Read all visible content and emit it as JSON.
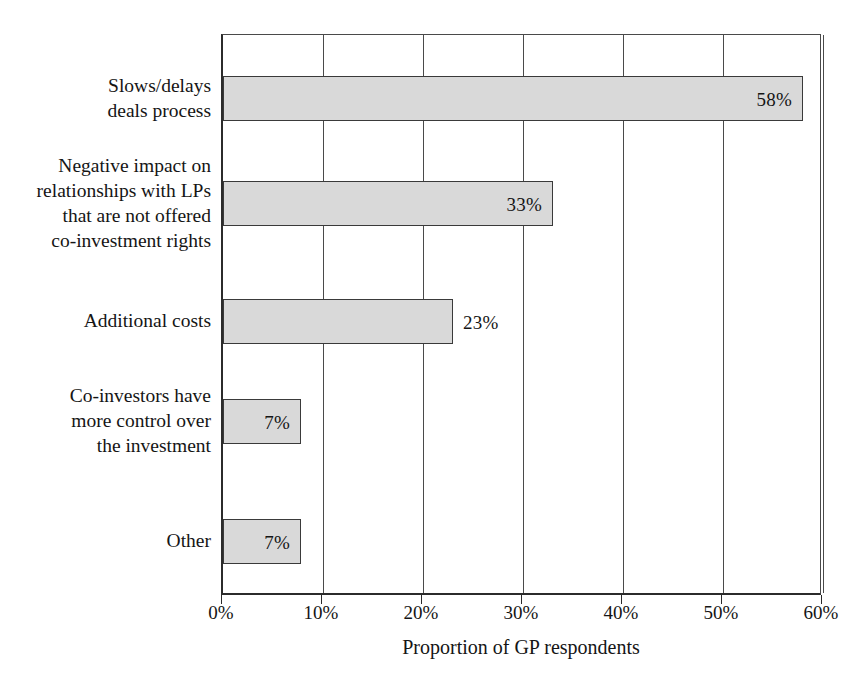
{
  "chart_data": {
    "type": "bar",
    "orientation": "horizontal",
    "title": "",
    "subtitle": "",
    "xlabel": "Proportion of GP respondents",
    "ylabel": "",
    "categories": [
      "Slows/delays\ndeals process",
      "Negative impact on\nrelationships with LPs\nthat are not offered\nco-investment rights",
      "Additional costs",
      "Co-investors have\nmore control over\nthe investment",
      "Other"
    ],
    "values": [
      58,
      33,
      23,
      7,
      7
    ],
    "value_labels": [
      "58%",
      "33%",
      "23%",
      "7%",
      "7%"
    ],
    "label_placement": [
      "inside",
      "inside",
      "outside",
      "inside",
      "inside"
    ],
    "xlim": [
      0,
      60
    ],
    "xticks": [
      0,
      10,
      20,
      30,
      40,
      50,
      60
    ],
    "xtick_labels": [
      "0%",
      "10%",
      "20%",
      "30%",
      "40%",
      "50%",
      "60%"
    ],
    "grid": "vertical",
    "legend": "none",
    "colors": {
      "bar_fill": "#d9d9d9",
      "bar_border": "#3a3a3a",
      "axis": "#2b2b2b",
      "gridline": "#4a4a4a",
      "text": "#151515",
      "background": "#ffffff"
    }
  }
}
